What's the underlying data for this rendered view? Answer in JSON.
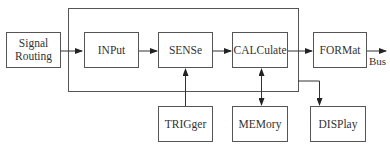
{
  "diagram": {
    "blocks": {
      "signal_routing": "Signal Routing",
      "input": "INPut",
      "sense": "SENSe",
      "calculate": "CALCulate",
      "format": "FORMat",
      "trigger": "TRIGger",
      "memory": "MEMory",
      "display": "DISPlay"
    },
    "output_label": "Bus"
  }
}
